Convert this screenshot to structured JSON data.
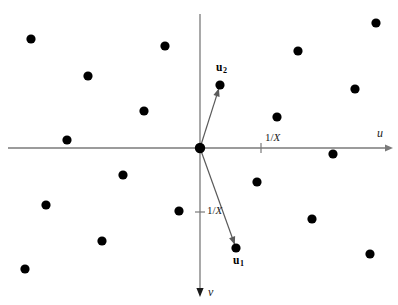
{
  "figure": {
    "title": "",
    "width": 398,
    "height": 305,
    "background_color": "#ffffff",
    "axis_color": "#7a7a7a",
    "vector_color": "#5a5a5a",
    "point_color": "#000000"
  },
  "axes": {
    "origin": {
      "x": 200,
      "y": 148
    },
    "horizontal": {
      "name": "u-axis",
      "label": "u",
      "label_pos": {
        "x": 377,
        "y": 127
      },
      "start": {
        "x": 8,
        "y": 148
      },
      "end": {
        "x": 393,
        "y": 148
      },
      "arrow": "right"
    },
    "vertical": {
      "name": "v-axis",
      "label": "v",
      "label_pos": {
        "x": 208,
        "y": 286
      },
      "start": {
        "x": 200,
        "y": 14
      },
      "end": {
        "x": 200,
        "y": 297
      },
      "arrow": "down"
    },
    "ticks": [
      {
        "id": "u-tick",
        "axis": "u",
        "label": "1/X",
        "pos": {
          "x": 261,
          "y": 148
        },
        "label_pos": {
          "x": 265,
          "y": 132
        }
      },
      {
        "id": "v-tick",
        "axis": "v",
        "label": "1/X",
        "pos": {
          "x": 200,
          "y": 212
        },
        "label_pos": {
          "x": 207,
          "y": 205
        }
      }
    ]
  },
  "vectors": [
    {
      "id": "u2",
      "label": "u",
      "subscript": "2",
      "from": {
        "x": 200,
        "y": 148
      },
      "to": {
        "x": 220,
        "y": 85
      },
      "label_pos": {
        "x": 216,
        "y": 62
      }
    },
    {
      "id": "u1",
      "label": "u",
      "subscript": "1",
      "from": {
        "x": 200,
        "y": 148
      },
      "to": {
        "x": 236,
        "y": 248
      },
      "label_pos": {
        "x": 233,
        "y": 255
      }
    }
  ],
  "chart_data": {
    "type": "scatter",
    "title": "",
    "xlabel": "u",
    "ylabel": "v",
    "grid": false,
    "legend": null,
    "note": "Reciprocal lattice points in the (u,v) plane with basis vectors u1 and u2; axis tick spacing labelled 1/X.",
    "annotations": [
      "u",
      "v",
      "1/X",
      "1/X",
      "u2",
      "u1"
    ],
    "points_pixel": [
      {
        "x": 31,
        "y": 39
      },
      {
        "x": 165,
        "y": 46
      },
      {
        "x": 88,
        "y": 76
      },
      {
        "x": 144,
        "y": 111
      },
      {
        "x": 67,
        "y": 140
      },
      {
        "x": 376,
        "y": 23
      },
      {
        "x": 298,
        "y": 51
      },
      {
        "x": 355,
        "y": 89
      },
      {
        "x": 277,
        "y": 117
      },
      {
        "x": 220,
        "y": 85
      },
      {
        "x": 123,
        "y": 175
      },
      {
        "x": 46,
        "y": 205
      },
      {
        "x": 102,
        "y": 241
      },
      {
        "x": 25,
        "y": 269
      },
      {
        "x": 179,
        "y": 211
      },
      {
        "x": 333,
        "y": 154
      },
      {
        "x": 257,
        "y": 182
      },
      {
        "x": 312,
        "y": 219
      },
      {
        "x": 370,
        "y": 254
      },
      {
        "x": 236,
        "y": 248
      }
    ],
    "point_radius": 4.6,
    "origin_point": {
      "x": 200,
      "y": 148,
      "radius": 5.2
    }
  }
}
